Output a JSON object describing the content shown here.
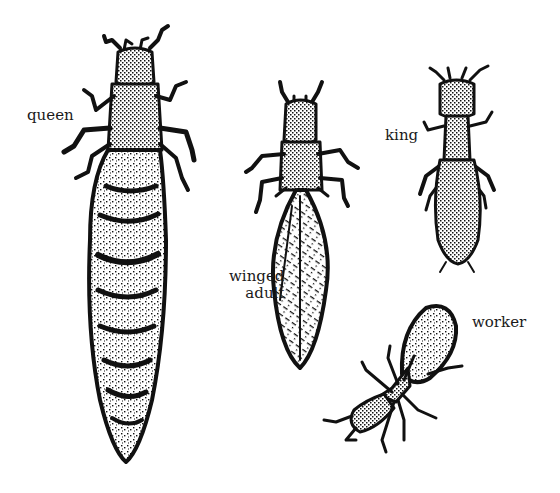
{
  "figure": {
    "background": "#ffffff",
    "ink": "#111111"
  },
  "labels": {
    "queen": "queen",
    "winged_adult_line1": "winged",
    "winged_adult_line2": "adult",
    "king": "king",
    "worker": "worker"
  },
  "insects": [
    {
      "id": "queen",
      "label": "queen",
      "body": "large segmented abdomen"
    },
    {
      "id": "winged-adult",
      "label": "winged adult",
      "body": "folded wings"
    },
    {
      "id": "king",
      "label": "king",
      "body": "small elongated"
    },
    {
      "id": "worker",
      "label": "worker",
      "body": "diagonal, small"
    }
  ]
}
